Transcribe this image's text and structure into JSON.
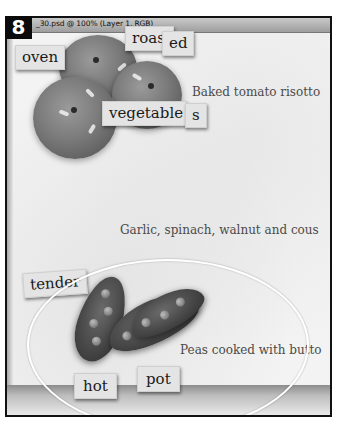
{
  "step_badge": "8",
  "window": {
    "title": "_30.psd @ 100% (Layer 1, RGB)"
  },
  "tiles": {
    "roast": "roast",
    "ed": "ed",
    "oven": "oven",
    "vegetable": "vegetable",
    "s": "s",
    "tender": "tender",
    "hot": "hot",
    "pot": "pot"
  },
  "captions": {
    "tomato": "Baked tomato risotto",
    "garlic": "Garlic, spinach, walnut and cous",
    "peas": "Peas cooked with butto"
  },
  "colors": {
    "frame_border": "#111111",
    "badge_bg": "#0b0b0b",
    "badge_text": "#ffffff",
    "tile_bg": "#e4e4e4",
    "caption_text": "#4a4a4a",
    "oval_stroke": "#ffffff"
  },
  "selection": {
    "shape": "ellipse",
    "tool": "elliptical-marquee"
  }
}
